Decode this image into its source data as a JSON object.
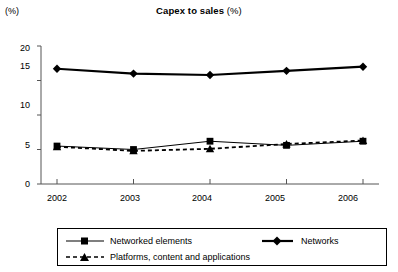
{
  "chart_data": {
    "type": "line",
    "title": "Capex to sales (%)",
    "title_bold_part": "Capex to sales",
    "title_light_part": " (%)",
    "unit_label": "(%)",
    "xlabel": "",
    "ylabel": "",
    "categories": [
      "2002",
      "2003",
      "2004",
      "2005",
      "2006"
    ],
    "x": [
      2002,
      2003,
      2004,
      2005,
      2006
    ],
    "ylim": [
      0,
      20
    ],
    "yticks": [
      0,
      5,
      10,
      15,
      20
    ],
    "ytick_labels": [
      "0",
      "5",
      "10",
      "15",
      "20"
    ],
    "grid": false,
    "legend_position": "bottom",
    "series": [
      {
        "name": "Networked elements",
        "marker": "square",
        "line_style": "solid",
        "color": "#000000",
        "values": [
          5.5,
          5.0,
          6.2,
          5.6,
          6.2
        ]
      },
      {
        "name": "Networks",
        "marker": "diamond",
        "line_style": "solid-thick",
        "color": "#000000",
        "values": [
          16.7,
          16.0,
          15.8,
          16.4,
          17.0
        ]
      },
      {
        "name": "Platforms, content and applications",
        "marker": "triangle",
        "line_style": "dashed",
        "color": "#000000",
        "values": [
          5.4,
          4.8,
          5.1,
          5.8,
          6.3
        ]
      }
    ]
  },
  "legend": {
    "entries": [
      {
        "label": "Networked elements"
      },
      {
        "label": "Networks"
      },
      {
        "label": "Platforms, content and applications"
      }
    ]
  }
}
